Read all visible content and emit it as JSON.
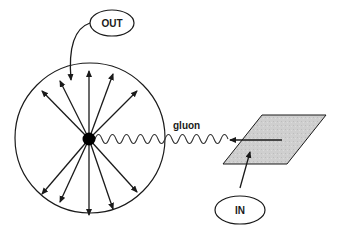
{
  "diagram": {
    "labels": {
      "out": "OUT",
      "in": "IN",
      "gluon": "gluon"
    },
    "colors": {
      "stroke": "#1a1a1a",
      "plane_fill": "#cfcfcf",
      "background": "#ffffff"
    },
    "elements": {
      "emission_sphere": "circle containing radial arrows",
      "source_point": "black dot at center-left of circle",
      "gluon_line": "wavy line from source point to plane",
      "plane": "shaded parallelogram with arrow pointing left",
      "out_callout": "ellipse labeled OUT with curved arrow into circle",
      "in_callout": "ellipse labeled IN with arrow pointing to plane"
    }
  }
}
